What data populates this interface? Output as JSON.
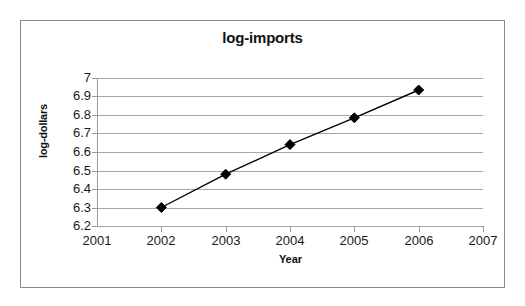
{
  "chart_data": {
    "type": "line",
    "title": "log-imports",
    "xlabel": "Year",
    "ylabel": "log-dollars",
    "x": [
      2002,
      2003,
      2004,
      2005,
      2006
    ],
    "values": [
      6.3,
      6.48,
      6.64,
      6.785,
      6.935
    ],
    "series": [
      {
        "name": "log-imports",
        "values": [
          6.3,
          6.48,
          6.64,
          6.785,
          6.935
        ]
      }
    ],
    "xlim": [
      2001,
      2007
    ],
    "ylim": [
      6.2,
      7
    ],
    "x_ticks": [
      "2001",
      "2002",
      "2003",
      "2004",
      "2005",
      "2006",
      "2007"
    ],
    "y_ticks": [
      "7",
      "6.9",
      "6.8",
      "6.7",
      "6.6",
      "6.5",
      "6.4",
      "6.3",
      "6.2"
    ],
    "y_tick_values": [
      7,
      6.9,
      6.8,
      6.7,
      6.6,
      6.5,
      6.4,
      6.3,
      6.2
    ],
    "grid": "horizontal",
    "legend": "none",
    "marker": "filled-diamond",
    "line_color": "#000000",
    "marker_color": "#000000",
    "gridline_color": "#a6a6a6",
    "border_color": "#8a8a8a",
    "background_color": "#ffffff"
  }
}
